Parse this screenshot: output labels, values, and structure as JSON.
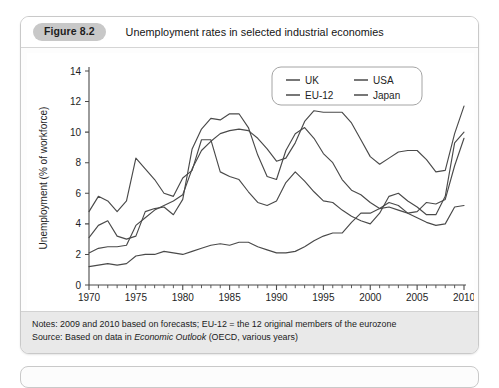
{
  "figure": {
    "badge": "Figure 8.2",
    "title": "Unemployment rates in selected industrial economies"
  },
  "notes": {
    "line1_prefix": "Notes: 2009 and 2010 based on forecasts; EU-12 = the 12 original members of the eurozone",
    "line2_prefix": "Source: Based on data in ",
    "line2_italic": "Economic Outlook",
    "line2_suffix": " (OECD, various years)"
  },
  "chart_data": {
    "type": "line",
    "title": "Unemployment rates in selected industrial economies",
    "xlabel": "",
    "ylabel": "Unemployment (% of workforce)",
    "xlim": [
      1970,
      2010
    ],
    "ylim": [
      0,
      14
    ],
    "yticks": [
      0,
      2,
      4,
      6,
      8,
      10,
      12,
      14
    ],
    "xticks": [
      1970,
      1975,
      1980,
      1985,
      1990,
      1995,
      2000,
      2005,
      2010
    ],
    "xminor_step": 1,
    "grid": false,
    "legend_position": "top-right",
    "line_color": "#4a4a4a",
    "x": [
      1970,
      1971,
      1972,
      1973,
      1974,
      1975,
      1976,
      1977,
      1978,
      1979,
      1980,
      1981,
      1982,
      1983,
      1984,
      1985,
      1986,
      1987,
      1988,
      1989,
      1990,
      1991,
      1992,
      1993,
      1994,
      1995,
      1996,
      1997,
      1998,
      1999,
      2000,
      2001,
      2002,
      2003,
      2004,
      2005,
      2006,
      2007,
      2008,
      2009,
      2010
    ],
    "series": [
      {
        "name": "UK",
        "values": [
          3.1,
          3.9,
          4.2,
          3.2,
          3.0,
          3.2,
          4.8,
          5.0,
          5.1,
          4.6,
          5.6,
          8.9,
          10.2,
          10.9,
          10.8,
          11.2,
          11.2,
          10.3,
          8.5,
          7.1,
          6.9,
          8.8,
          9.9,
          10.3,
          9.6,
          8.6,
          8.0,
          6.9,
          6.2,
          5.9,
          5.4,
          5.0,
          5.1,
          4.9,
          4.7,
          4.8,
          5.4,
          5.3,
          5.6,
          7.8,
          9.6
        ]
      },
      {
        "name": "USA",
        "values": [
          4.8,
          5.8,
          5.5,
          4.8,
          5.5,
          8.3,
          7.6,
          6.9,
          6.0,
          5.8,
          7.0,
          7.5,
          9.5,
          9.5,
          7.4,
          7.1,
          6.9,
          6.1,
          5.4,
          5.2,
          5.5,
          6.7,
          7.4,
          6.8,
          6.1,
          5.5,
          5.4,
          4.9,
          4.5,
          4.2,
          4.0,
          4.7,
          5.8,
          6.0,
          5.5,
          5.1,
          4.6,
          4.6,
          5.8,
          9.3,
          10.0
        ]
      },
      {
        "name": "EU-12",
        "values": [
          2.1,
          2.4,
          2.5,
          2.5,
          2.6,
          3.9,
          4.4,
          4.9,
          5.2,
          5.5,
          5.9,
          7.6,
          8.8,
          9.4,
          9.9,
          10.1,
          10.2,
          10.1,
          9.6,
          8.9,
          8.1,
          8.3,
          9.3,
          10.7,
          11.4,
          11.3,
          11.3,
          11.3,
          10.6,
          9.5,
          8.4,
          7.9,
          8.3,
          8.7,
          8.8,
          8.8,
          8.2,
          7.4,
          7.5,
          9.9,
          11.7
        ]
      },
      {
        "name": "Japan",
        "values": [
          1.2,
          1.3,
          1.4,
          1.3,
          1.4,
          1.9,
          2.0,
          2.0,
          2.2,
          2.1,
          2.0,
          2.2,
          2.4,
          2.6,
          2.7,
          2.6,
          2.8,
          2.8,
          2.5,
          2.3,
          2.1,
          2.1,
          2.2,
          2.5,
          2.9,
          3.2,
          3.4,
          3.4,
          4.1,
          4.7,
          4.7,
          5.0,
          5.4,
          5.2,
          4.7,
          4.4,
          4.1,
          3.9,
          4.0,
          5.1,
          5.2
        ]
      }
    ],
    "legend": [
      {
        "label": "UK"
      },
      {
        "label": "USA"
      },
      {
        "label": "EU-12"
      },
      {
        "label": "Japan"
      }
    ]
  }
}
